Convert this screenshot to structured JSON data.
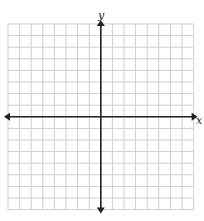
{
  "graph": {
    "x_axis_label": "x",
    "y_axis_label": "y",
    "grid": {
      "columns": 16,
      "rows": 16,
      "left": 8,
      "top": 24,
      "cell": 11.6,
      "line_color": "#cfcfcf",
      "axis_color": "#222222"
    },
    "x_range": [
      -8,
      8
    ],
    "y_range": [
      -8,
      8
    ]
  }
}
